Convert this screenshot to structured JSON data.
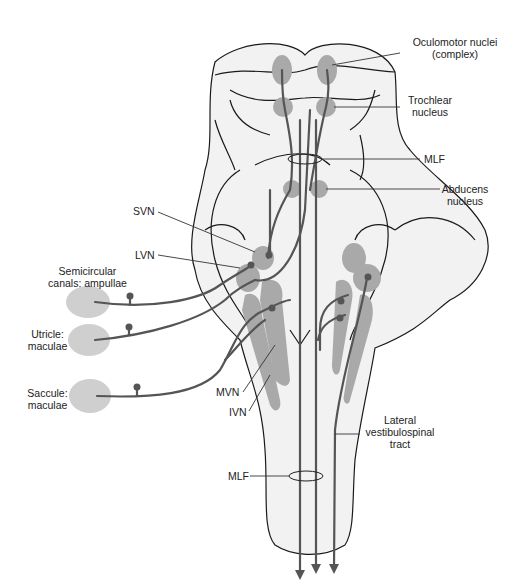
{
  "figure": {
    "colors": {
      "outline": "#1a1a1a",
      "brainstem_fill": "#f2f2f2",
      "nucleus_fill": "#a9a9a9",
      "receptor_fill": "#cfcfcf",
      "fiber": "#555555"
    }
  },
  "labels": {
    "oculomotor": [
      "Oculomotor nuclei",
      "(complex)"
    ],
    "trochlear": [
      "Trochlear",
      "nucleus"
    ],
    "mlf_top": "MLF",
    "abducens": [
      "Abducens",
      "nucleus"
    ],
    "svn": "SVN",
    "lvn": "LVN",
    "semicircular": [
      "Semicircular",
      "canals: ampullae"
    ],
    "utricle": [
      "Utricle:",
      "maculae"
    ],
    "saccule": [
      "Saccule:",
      "maculae"
    ],
    "mvn": "MVN",
    "ivn": "IVN",
    "lateral_tract": [
      "Lateral",
      "vestibulospinal",
      "tract"
    ],
    "mlf_bottom": "MLF"
  }
}
